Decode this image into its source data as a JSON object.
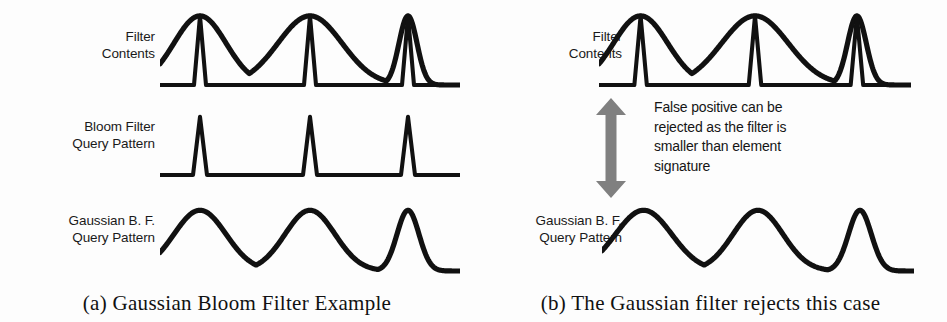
{
  "figure": {
    "background": "#fdfdfd",
    "ink_color": "#111111",
    "arrow_color": "#808080"
  },
  "panels": [
    {
      "id": "a",
      "caption": "(a) Gaussian Bloom Filter Example",
      "rows": [
        {
          "label": "Filter\nContents"
        },
        {
          "label": "Bloom Filter\nQuery Pattern"
        },
        {
          "label": "Gaussian B. F.\nQuery Pattern"
        }
      ]
    },
    {
      "id": "b",
      "caption": "(b) The Gaussian filter rejects this case",
      "rows": [
        {
          "label": "Filter\nContents"
        },
        {
          "label": "Gaussian B. F.\nQuery Pattern"
        }
      ],
      "annotation": {
        "text": "False positive can be\nrejected as the filter is\nsmaller than element\nsignature",
        "arrow_name": "double-headed-vertical-arrow",
        "arrow_color": "#808080"
      }
    }
  ],
  "chart_data": {
    "type": "line",
    "xlabel": "",
    "ylabel": "",
    "xlim": [
      0,
      300
    ],
    "ylim": [
      0,
      1
    ],
    "grid": false,
    "legend": null,
    "traces": [
      {
        "name": "panel-a-filter-contents-gaussian-envelope",
        "panel": "a",
        "row": "Filter Contents",
        "style": "smooth-gaussian-sum",
        "description": "Sum of three Gaussians of decreasing width representing stored element signatures",
        "gaussians": [
          {
            "center": 40,
            "height": 0.96,
            "sigma": 26
          },
          {
            "center": 150,
            "height": 0.96,
            "sigma": 32
          },
          {
            "center": 248,
            "height": 0.96,
            "sigma": 9
          }
        ]
      },
      {
        "name": "panel-a-filter-contents-spikes",
        "panel": "a",
        "row": "Filter Contents",
        "style": "sharp-spikes",
        "description": "Narrow triangular spikes marking hash positions",
        "spikes": [
          {
            "center": 40,
            "height": 0.96,
            "halfwidth": 6
          },
          {
            "center": 150,
            "height": 0.96,
            "halfwidth": 6
          },
          {
            "center": 248,
            "height": 0.96,
            "halfwidth": 6
          }
        ]
      },
      {
        "name": "panel-a-bloom-query-pattern",
        "panel": "a",
        "row": "Bloom Filter Query Pattern",
        "style": "sharp-spikes",
        "description": "Three equal narrow spikes of the query signature",
        "spikes": [
          {
            "center": 40,
            "height": 0.94,
            "halfwidth": 7
          },
          {
            "center": 150,
            "height": 0.94,
            "halfwidth": 7
          },
          {
            "center": 248,
            "height": 0.94,
            "halfwidth": 7
          }
        ]
      },
      {
        "name": "panel-a-gaussian-query-pattern",
        "panel": "a",
        "row": "Gaussian B. F. Query Pattern",
        "style": "smooth-gaussian-sum",
        "description": "Three Gaussian bumps of decreasing width matching the filter contents",
        "gaussians": [
          {
            "center": 40,
            "height": 0.92,
            "sigma": 26
          },
          {
            "center": 150,
            "height": 0.92,
            "sigma": 25
          },
          {
            "center": 248,
            "height": 0.92,
            "sigma": 11
          }
        ]
      },
      {
        "name": "panel-b-filter-contents-gaussian-envelope",
        "panel": "b",
        "row": "Filter Contents",
        "style": "smooth-gaussian-sum",
        "description": "Same filter contents envelope as panel (a)",
        "gaussians": [
          {
            "center": 40,
            "height": 0.96,
            "sigma": 26
          },
          {
            "center": 150,
            "height": 0.96,
            "sigma": 32
          },
          {
            "center": 248,
            "height": 0.96,
            "sigma": 9
          }
        ]
      },
      {
        "name": "panel-b-filter-contents-spikes",
        "panel": "b",
        "row": "Filter Contents",
        "style": "sharp-spikes",
        "spikes": [
          {
            "center": 40,
            "height": 0.96,
            "halfwidth": 6
          },
          {
            "center": 150,
            "height": 0.96,
            "halfwidth": 6
          },
          {
            "center": 248,
            "height": 0.96,
            "halfwidth": 6
          }
        ]
      },
      {
        "name": "panel-b-gaussian-query-pattern",
        "panel": "b",
        "row": "Gaussian B. F. Query Pattern",
        "style": "smooth-gaussian-sum",
        "description": "Query Gaussians wider than the stored third signature, so the query is rejected",
        "gaussians": [
          {
            "center": 40,
            "height": 0.92,
            "sigma": 27
          },
          {
            "center": 150,
            "height": 0.92,
            "sigma": 24
          },
          {
            "center": 248,
            "height": 0.92,
            "sigma": 11
          }
        ]
      }
    ]
  }
}
